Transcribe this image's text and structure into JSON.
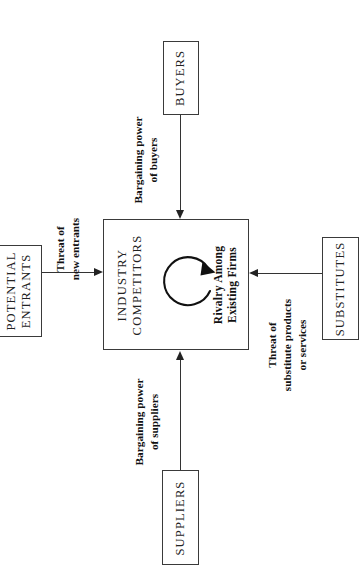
{
  "diagram": {
    "orientation": "rotated-90-ccw",
    "central": {
      "title_line1": "INDUSTRY",
      "title_line2": "COMPETITORS",
      "rivalry_line1": "Rivalry Among",
      "rivalry_line2": "Existing Firms",
      "rotation_icon": "circular-arrow-icon"
    },
    "nodes": {
      "potential_entrants": {
        "label_line1": "POTENTIAL",
        "label_line2": "ENTRANTS"
      },
      "buyers": {
        "label_line1": "BUYERS"
      },
      "substitutes": {
        "label_line1": "SUBSTITUTES"
      },
      "suppliers": {
        "label_line1": "SUPPLIERS"
      }
    },
    "edges": {
      "threat_of_new_entrants": {
        "line1": "Threat of",
        "line2": "new entrants"
      },
      "bargaining_power_of_buyers": {
        "line1": "Bargaining power",
        "line2": "of buyers"
      },
      "threat_of_substitutes": {
        "line1": "Threat of",
        "line2": "substitute products",
        "line3": "or services"
      },
      "bargaining_power_of_suppliers": {
        "line1": "Bargaining power",
        "line2": "of suppliers"
      }
    },
    "colors": {
      "stroke": "#333333",
      "text": "#111111",
      "background": "#ffffff"
    }
  }
}
